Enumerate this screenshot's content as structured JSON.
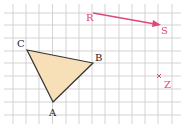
{
  "grid": {
    "x0": 0,
    "y0": 0,
    "spacing": 12.75,
    "color": "#c8c8c8"
  },
  "triangle": {
    "fill": "#f7dfb8",
    "stroke": "#333333",
    "points": {
      "A": [
        53,
        102
      ],
      "B": [
        93,
        63
      ],
      "C": [
        27,
        50
      ]
    },
    "labels": {
      "A": "A",
      "B": "B",
      "C": "C"
    }
  },
  "vector": {
    "from_label": "R",
    "to_label": "S",
    "from": [
      93,
      13
    ],
    "to": [
      160,
      25
    ],
    "color": "#e0457b"
  },
  "point_z": {
    "label": "Z",
    "pos": [
      159,
      76
    ],
    "color": "#e0457b"
  }
}
